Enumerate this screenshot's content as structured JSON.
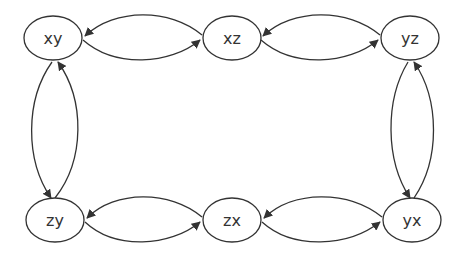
{
  "diagram": {
    "type": "directed-graph",
    "nodes": [
      {
        "id": "xy",
        "label": "xy",
        "cx": 53,
        "cy": 38
      },
      {
        "id": "xz",
        "label": "xz",
        "cx": 232,
        "cy": 38
      },
      {
        "id": "yz",
        "label": "yz",
        "cx": 410,
        "cy": 38
      },
      {
        "id": "zy",
        "label": "zy",
        "cx": 55,
        "cy": 220
      },
      {
        "id": "zx",
        "label": "zx",
        "cx": 232,
        "cy": 220
      },
      {
        "id": "yx",
        "label": "yx",
        "cx": 412,
        "cy": 220
      }
    ],
    "edges": [
      {
        "from": "xz",
        "to": "xy"
      },
      {
        "from": "xy",
        "to": "xz"
      },
      {
        "from": "yz",
        "to": "xz"
      },
      {
        "from": "xz",
        "to": "yz"
      },
      {
        "from": "zy",
        "to": "xy"
      },
      {
        "from": "xy",
        "to": "zy"
      },
      {
        "from": "yx",
        "to": "yz"
      },
      {
        "from": "yz",
        "to": "yx"
      },
      {
        "from": "zx",
        "to": "zy"
      },
      {
        "from": "zy",
        "to": "zx"
      },
      {
        "from": "yx",
        "to": "zx"
      },
      {
        "from": "zx",
        "to": "yx"
      }
    ],
    "colors": {
      "stroke": "#333333",
      "background": "#ffffff"
    }
  }
}
